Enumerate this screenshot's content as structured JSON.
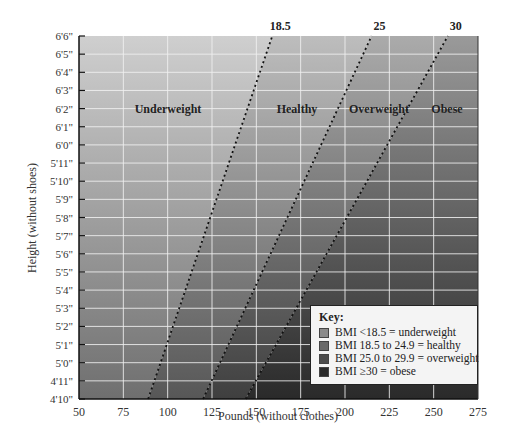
{
  "chart_data": {
    "type": "area",
    "title": "",
    "xlabel": "Pounds (without clothes)",
    "ylabel": "Height (without shoes)",
    "xlim": [
      50,
      275
    ],
    "ylim_labels": [
      "4'10\"",
      "6'6\""
    ],
    "x_ticks": [
      50,
      75,
      100,
      125,
      150,
      175,
      200,
      225,
      250,
      275
    ],
    "y_ticks": [
      "4'10\"",
      "4'11\"",
      "5'0\"",
      "5'1\"",
      "5'2\"",
      "5'3\"",
      "5'4\"",
      "5'5\"",
      "5'6\"",
      "5'7\"",
      "5'8\"",
      "5'9\"",
      "5'10\"",
      "5'11\"",
      "6'0\"",
      "6'1\"",
      "6'2\"",
      "6'3\"",
      "6'4\"",
      "6'5\"",
      "6'6\""
    ],
    "grid": true,
    "bmi_lines": [
      {
        "label": "18.5",
        "bottom_lb": 89,
        "top_lb": 159
      },
      {
        "label": "25",
        "bottom_lb": 120,
        "top_lb": 215
      },
      {
        "label": "30",
        "bottom_lb": 144,
        "top_lb": 258
      }
    ],
    "zones": [
      {
        "label": "Underweight"
      },
      {
        "label": "Healthy"
      },
      {
        "label": "Overweight"
      },
      {
        "label": "Obese"
      }
    ],
    "legend": {
      "title": "Key:",
      "position": "lower right",
      "entries": [
        {
          "label": "BMI <18.5 = underweight",
          "color": "#8a8a8a"
        },
        {
          "label": "BMI 18.5 to 24.9 = healthy",
          "color": "#6a6a6a"
        },
        {
          "label": "BMI 25.0 to 29.9 = overweight",
          "color": "#4c4c4c"
        },
        {
          "label": "BMI ≥30 = obese",
          "color": "#2a2a2a"
        }
      ]
    }
  }
}
